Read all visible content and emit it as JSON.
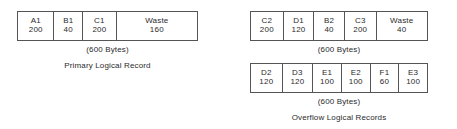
{
  "diagram": {
    "background_color": "#ffffff",
    "line_color": "#555555",
    "text_color": "#2b2b2b"
  },
  "groups": [
    {
      "id": "primary",
      "name": "primary-logical-record",
      "block_size_caption": "(600 Bytes)",
      "title_caption": "Primary Logical Record",
      "total_bytes": 600,
      "segments": [
        {
          "label": "A1",
          "value": "200",
          "bytes": 200,
          "width_pct": 19.8
        },
        {
          "label": "B1",
          "value": "40",
          "bytes": 40,
          "width_pct": 16.0
        },
        {
          "label": "C1",
          "value": "200",
          "bytes": 200,
          "width_pct": 18.8
        },
        {
          "label": "Waste",
          "value": "160",
          "bytes": 160,
          "width_pct": 45.4
        }
      ]
    },
    {
      "id": "overflow-one",
      "name": "overflow-logical-record-row-1",
      "block_size_caption": "(600 Bytes)",
      "title_caption": "",
      "total_bytes": 600,
      "segments": [
        {
          "label": "C2",
          "value": "200",
          "bytes": 200,
          "width_pct": 18.0
        },
        {
          "label": "D1",
          "value": "120",
          "bytes": 120,
          "width_pct": 17.4
        },
        {
          "label": "B2",
          "value": "40",
          "bytes": 40,
          "width_pct": 17.4
        },
        {
          "label": "C3",
          "value": "200",
          "bytes": 200,
          "width_pct": 18.0
        },
        {
          "label": "Waste",
          "value": "40",
          "bytes": 40,
          "width_pct": 29.2
        }
      ]
    },
    {
      "id": "overflow-two",
      "name": "overflow-logical-record-row-2",
      "block_size_caption": "(600 Bytes)",
      "title_caption": "Overflow Logical Records",
      "total_bytes": 600,
      "segments": [
        {
          "label": "D2",
          "value": "120",
          "bytes": 120,
          "width_pct": 17.4
        },
        {
          "label": "D3",
          "value": "120",
          "bytes": 120,
          "width_pct": 17.4
        },
        {
          "label": "E1",
          "value": "100",
          "bytes": 100,
          "width_pct": 16.3
        },
        {
          "label": "E2",
          "value": "100",
          "bytes": 100,
          "width_pct": 16.3
        },
        {
          "label": "F1",
          "value": "60",
          "bytes": 60,
          "width_pct": 16.3
        },
        {
          "label": "E3",
          "value": "100",
          "bytes": 100,
          "width_pct": 16.3
        }
      ]
    }
  ]
}
